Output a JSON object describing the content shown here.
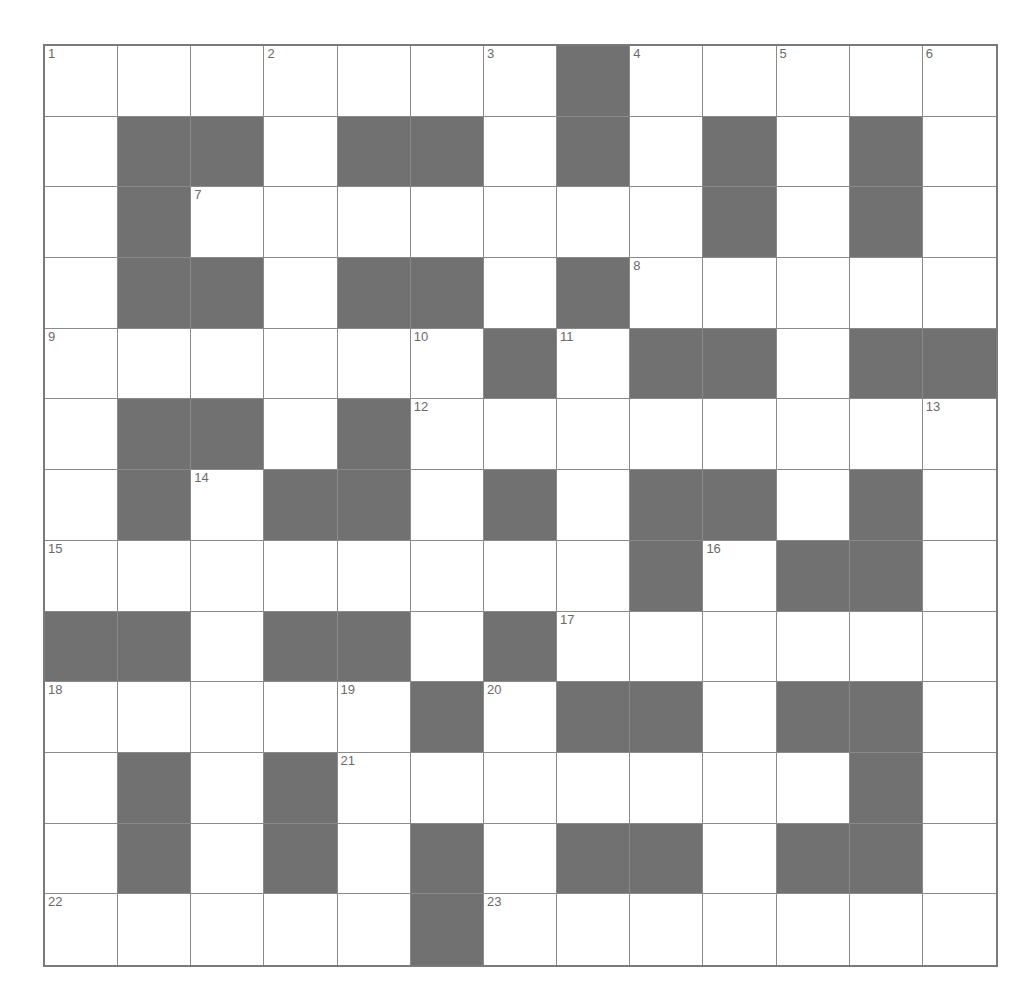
{
  "puzzle": {
    "rows": 13,
    "cols": 13,
    "colors": {
      "block": "#717171",
      "cell": "#ffffff",
      "line": "#8a8a8a"
    },
    "layout": [
      "WWWWWWWBWWWWW",
      "WBBWBBWBWBWBW",
      "WBWWWWWWWBWBW",
      "WBBWBBWBWWWWW",
      "WWWWWWBWBBWBB",
      "WBBWBWWWWWWWW",
      "WBWBBWBWBBWBW",
      "WWWWWWWWBWBBW",
      "BBWBBWBWWWWWW",
      "WWWWWBWBBWBBW",
      "WBWBWWWWWWWBW",
      "WBWBWBWBBWBBW",
      "WWWWWBWWWWWWW"
    ],
    "numbers": [
      {
        "r": 0,
        "c": 0,
        "n": "1"
      },
      {
        "r": 0,
        "c": 3,
        "n": "2"
      },
      {
        "r": 0,
        "c": 6,
        "n": "3"
      },
      {
        "r": 0,
        "c": 8,
        "n": "4"
      },
      {
        "r": 0,
        "c": 10,
        "n": "5"
      },
      {
        "r": 0,
        "c": 12,
        "n": "6"
      },
      {
        "r": 2,
        "c": 2,
        "n": "7"
      },
      {
        "r": 3,
        "c": 8,
        "n": "8"
      },
      {
        "r": 4,
        "c": 0,
        "n": "9"
      },
      {
        "r": 4,
        "c": 5,
        "n": "10"
      },
      {
        "r": 4,
        "c": 7,
        "n": "11"
      },
      {
        "r": 5,
        "c": 5,
        "n": "12"
      },
      {
        "r": 5,
        "c": 12,
        "n": "13"
      },
      {
        "r": 6,
        "c": 2,
        "n": "14"
      },
      {
        "r": 7,
        "c": 0,
        "n": "15"
      },
      {
        "r": 7,
        "c": 9,
        "n": "16"
      },
      {
        "r": 8,
        "c": 7,
        "n": "17"
      },
      {
        "r": 9,
        "c": 0,
        "n": "18"
      },
      {
        "r": 9,
        "c": 4,
        "n": "19"
      },
      {
        "r": 9,
        "c": 6,
        "n": "20"
      },
      {
        "r": 10,
        "c": 4,
        "n": "21"
      },
      {
        "r": 12,
        "c": 0,
        "n": "22"
      },
      {
        "r": 12,
        "c": 6,
        "n": "23"
      }
    ]
  }
}
